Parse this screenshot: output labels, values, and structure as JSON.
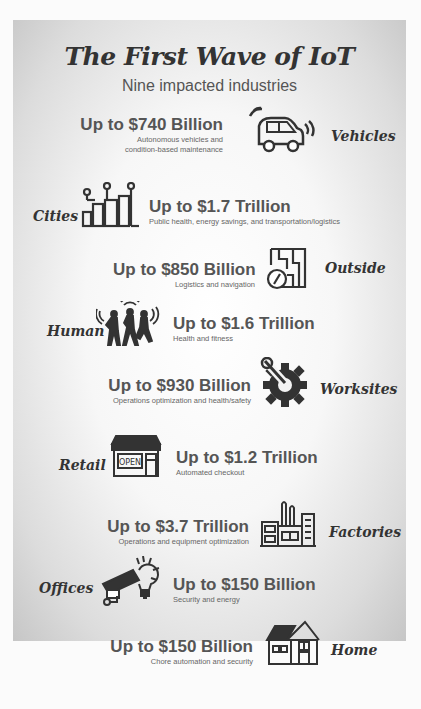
{
  "header": {
    "title": "The First Wave of IoT",
    "subtitle": "Nine impacted industries"
  },
  "industries": [
    {
      "name": "Vehicles",
      "amount": "Up to $740 Billion",
      "desc_line1": "Autonomous vehicles and",
      "desc_line2": "condition-based maintenance",
      "icon": "car-icon"
    },
    {
      "name": "Cities",
      "amount": "Up to $1.7 Trillion",
      "desc_line1": "Public health, energy savings, and transportation/logistics",
      "icon": "city-icon"
    },
    {
      "name": "Outside",
      "amount": "Up to $850 Billion",
      "desc_line1": "Logistics and navigation",
      "icon": "map-compass-icon"
    },
    {
      "name": "Human",
      "amount": "Up to $1.6 Trillion",
      "desc_line1": "Health and fitness",
      "icon": "runners-icon"
    },
    {
      "name": "Worksites",
      "amount": "Up to $930 Billion",
      "desc_line1": "Operations optimization and health/safety",
      "icon": "wrench-gear-icon"
    },
    {
      "name": "Retail",
      "amount": "Up to $1.2 Trillion",
      "desc_line1": "Automated checkout",
      "icon": "storefront-icon",
      "sign": "OPEN"
    },
    {
      "name": "Factories",
      "amount": "Up to $3.7 Trillion",
      "desc_line1": "Operations and equipment optimization",
      "icon": "factory-icon"
    },
    {
      "name": "Offices",
      "amount": "Up to $150 Billion",
      "desc_line1": "Security and energy",
      "icon": "camera-lightbulb-icon"
    },
    {
      "name": "Home",
      "amount": "Up to $150 Billion",
      "desc_line1": "Chore automation and security",
      "icon": "house-icon"
    }
  ]
}
